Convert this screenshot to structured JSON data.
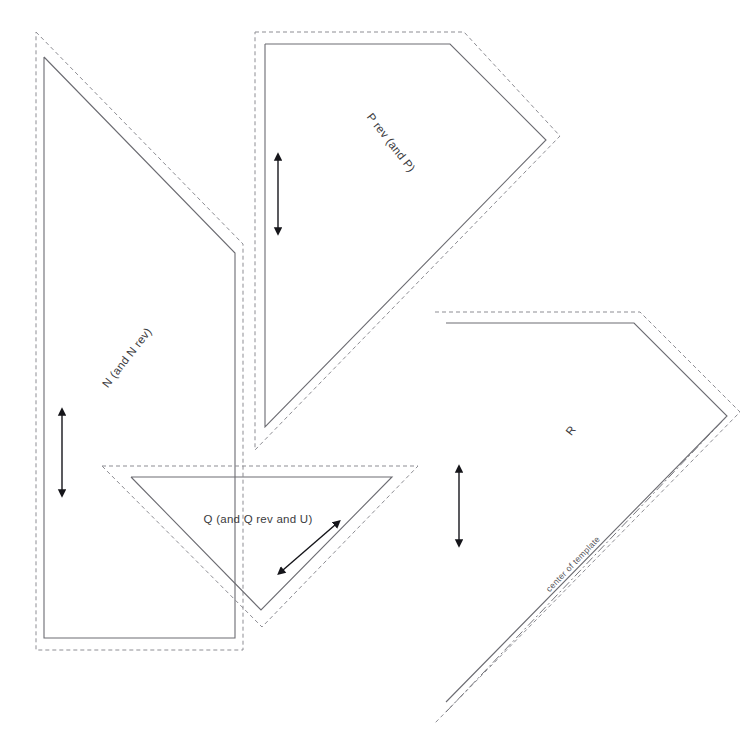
{
  "diagram": {
    "background_color": "#ffffff",
    "cut_line_color": "#8d8d93",
    "sew_line_color": "#6c6c72",
    "center_line_color": "#77777d",
    "arrow_color": "#15151a",
    "label_color": "#3b3b40"
  },
  "labels": {
    "piece_n": "N (and N rev)",
    "piece_p": "P rev (and P)",
    "piece_q": "Q (and Q rev and U)",
    "piece_r": "R",
    "center_of_template": "center of template"
  },
  "label_positions": {
    "piece_n": {
      "x": 130,
      "y": 360,
      "rotation": -52
    },
    "piece_p": {
      "x": 388,
      "y": 145,
      "rotation": 52
    },
    "piece_q": {
      "x": 258,
      "y": 519,
      "rotation": 0
    },
    "piece_r": {
      "x": 574,
      "y": 433,
      "rotation": -52
    },
    "center_of_template": {
      "x": 575,
      "y": 568,
      "rotation": -45
    }
  },
  "pieces": [
    {
      "id": "N",
      "name": "piece-n",
      "label": "N (and N rev)",
      "sew_line_points": "44,57 235,253 235,638 44,638 44,57",
      "cut_line_points": "36,32 243,244 243,650 36,650 36,32",
      "grain_arrow": {
        "x1": 62,
        "y1": 415,
        "x2": 62,
        "y2": 490,
        "direction": "double-vertical"
      }
    },
    {
      "id": "P",
      "name": "piece-p",
      "label": "P rev (and P)",
      "sew_line_points": "265,44 450,44 546,140 265,427 265,44",
      "cut_line_points": "255,32 464,32 560,136 255,450 255,32",
      "grain_arrow": {
        "x1": 278,
        "y1": 160,
        "x2": 278,
        "y2": 228,
        "direction": "double-vertical"
      }
    },
    {
      "id": "Q",
      "name": "piece-q",
      "label": "Q (and Q rev and U)",
      "sew_line_points": "131,477 392,477 261,610 131,477",
      "cut_line_points": "102,466 418,466 262,627 102,466",
      "grain_arrow": {
        "x1": 283,
        "y1": 570,
        "x2": 335,
        "y2": 525,
        "direction": "double-diagonal"
      }
    },
    {
      "id": "R",
      "name": "piece-r",
      "label": "R",
      "sew_line_points": "446,323 634,323 727,416 446,702",
      "cut_line_points": "435,312 640,312 740,412 435,723",
      "grain_arrow": {
        "x1": 459,
        "y1": 472,
        "x2": 459,
        "y2": 540,
        "direction": "double-vertical"
      },
      "center_line": {
        "x1": 446,
        "y1": 712,
        "x2": 727,
        "y2": 416
      }
    }
  ]
}
